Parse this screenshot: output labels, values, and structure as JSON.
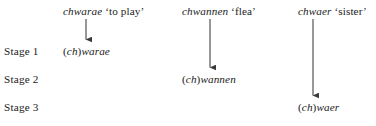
{
  "figure": {
    "type": "linguistic-derivation-diagram",
    "background_color": "#ffffff",
    "text_color": "#1b1b1b",
    "arrow_color": "#3a3a3a",
    "stage_rows": [
      {
        "label": "Stage 1",
        "y": 45
      },
      {
        "label": "Stage 2",
        "y": 73
      },
      {
        "label": "Stage 3",
        "y": 101
      }
    ],
    "columns": [
      {
        "header_word": "chwarae",
        "header_gloss": "‘to play’",
        "header_x": 63,
        "header_y": 5,
        "arrow_x": 86,
        "arrow_top": 19,
        "arrow_bottom": 41,
        "result_paren_open": "(",
        "result_ch": "ch",
        "result_paren_close": ")",
        "result_rest": "warae",
        "result_x": 63,
        "result_stage": "Stage 1",
        "result_y": 45
      },
      {
        "header_word": "chwannen",
        "header_gloss": "‘flea’",
        "header_x": 182,
        "header_y": 5,
        "arrow_x": 210,
        "arrow_top": 19,
        "arrow_bottom": 69,
        "result_paren_open": "(",
        "result_ch": "ch",
        "result_paren_close": ")",
        "result_rest": "wannen",
        "result_x": 182,
        "result_stage": "Stage 2",
        "result_y": 73
      },
      {
        "header_word": "chwaer",
        "header_gloss": "‘sister’",
        "header_x": 298,
        "header_y": 5,
        "arrow_x": 313,
        "arrow_top": 19,
        "arrow_bottom": 97,
        "result_paren_open": "(",
        "result_ch": "ch",
        "result_paren_close": ")",
        "result_rest": "waer",
        "result_x": 298,
        "result_stage": "Stage 3",
        "result_y": 101
      }
    ]
  }
}
